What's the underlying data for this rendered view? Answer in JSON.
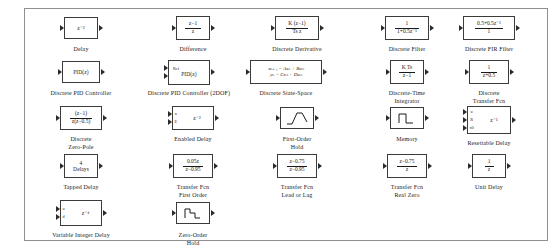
{
  "window": {
    "title": "Discrete",
    "background": "#ffffff",
    "border_color": "#8f8f8f",
    "block_border_color": "#3b3b3b",
    "text_color": "#1a1a1a"
  },
  "blocks": [
    {
      "id": "delay",
      "caption": "Delay",
      "expr": "z⁻²",
      "kind": "expr",
      "inputs": 1,
      "outputs": 1,
      "x": 38,
      "y": 14,
      "w": 32,
      "h": 22
    },
    {
      "id": "difference",
      "caption": "Difference",
      "kind": "fraction",
      "num": "z−1",
      "den": "z",
      "inputs": 1,
      "outputs": 1,
      "x": 150,
      "y": 14,
      "w": 34,
      "h": 24
    },
    {
      "id": "discrete-derivative",
      "caption": "Discrete Derivative",
      "kind": "fraction",
      "num": "K (z−1)",
      "den": "Ts z",
      "inputs": 1,
      "outputs": 1,
      "x": 248,
      "y": 14,
      "w": 44,
      "h": 24
    },
    {
      "id": "discrete-filter",
      "caption": "Discrete Filter",
      "kind": "fraction",
      "num": "1",
      "den": "1+0.5z⁻¹",
      "inputs": 1,
      "outputs": 1,
      "x": 362,
      "y": 14,
      "w": 44,
      "h": 24
    },
    {
      "id": "discrete-fir-filter",
      "caption": "Discrete FIR Filter",
      "kind": "fraction",
      "num": "0.5+0.5z⁻¹",
      "den": "1",
      "inputs": 1,
      "outputs": 1,
      "x": 472,
      "y": 14,
      "w": 50,
      "h": 24
    },
    {
      "id": "discrete-pid-controller",
      "caption": "Discrete PID Controller",
      "kind": "expr",
      "expr": "PID(z)",
      "inputs": 1,
      "outputs": 1,
      "x": 38,
      "y": 58,
      "w": 38,
      "h": 22
    },
    {
      "id": "discrete-pid-controller-2dof",
      "caption": "Discrete PID Controller (2DOF)",
      "kind": "expr-two-port",
      "expr": "PID(z)",
      "port_label": "Ref",
      "inputs": 2,
      "outputs": 1,
      "x": 150,
      "y": 58,
      "w": 42,
      "h": 24
    },
    {
      "id": "discrete-state-space",
      "caption": "Discrete State-Space",
      "kind": "equations",
      "eq1": "xₙ₊₁ = Axₙ + Buₙ",
      "eq2": "yₙ = Cxₙ + Duₙ",
      "inputs": 1,
      "outputs": 1,
      "x": 258,
      "y": 58,
      "w": 72,
      "h": 24
    },
    {
      "id": "discrete-time-integrator",
      "caption": "Discrete-Time\nIntegrator",
      "kind": "fraction",
      "num": "K Ts",
      "den": "z−1",
      "inputs": 1,
      "outputs": 1,
      "x": 362,
      "y": 58,
      "w": 32,
      "h": 24
    },
    {
      "id": "discrete-transfer-fcn",
      "caption": "Discrete\nTransfer Fcn",
      "kind": "fraction",
      "num": "1",
      "den": "z+0.5",
      "inputs": 1,
      "outputs": 1,
      "x": 472,
      "y": 58,
      "w": 40,
      "h": 24
    },
    {
      "id": "discrete-zero-pole",
      "caption": "Discrete\nZero-Pole",
      "kind": "fraction",
      "num": "(z−1)",
      "den": "z(z−0.5)",
      "inputs": 1,
      "outputs": 1,
      "x": 38,
      "y": 103,
      "w": 42,
      "h": 24
    },
    {
      "id": "enabled-delay",
      "caption": "Enabled Delay",
      "kind": "expr-two-port",
      "expr": "z⁻²",
      "port_label_1": "u",
      "port_label_2": "E",
      "inputs": 2,
      "outputs": 1,
      "x": 150,
      "y": 103,
      "w": 42,
      "h": 24
    },
    {
      "id": "first-order-hold",
      "caption": "First-Order\nHold",
      "kind": "glyph-foh",
      "inputs": 1,
      "outputs": 1,
      "x": 258,
      "y": 103,
      "w": 28,
      "h": 22
    },
    {
      "id": "memory",
      "caption": "Memory",
      "kind": "glyph-memory",
      "inputs": 1,
      "outputs": 1,
      "x": 362,
      "y": 103,
      "w": 24,
      "h": 22
    },
    {
      "id": "resettable-delay",
      "caption": "Resettable Delay",
      "kind": "expr-three-port",
      "expr": "z⁻¹",
      "port_label_1": "u",
      "port_label_2": "R",
      "port_label_3": "x0",
      "inputs": 3,
      "outputs": 1,
      "x": 472,
      "y": 103,
      "w": 44,
      "h": 28
    },
    {
      "id": "tapped-delay",
      "caption": "Tapped Delay",
      "kind": "stacked-expr",
      "line1": "4",
      "line2": "Delays",
      "inputs": 1,
      "outputs": 1,
      "x": 38,
      "y": 152,
      "w": 34,
      "h": 24
    },
    {
      "id": "transfer-fcn-first-order",
      "caption": "Transfer Fcn\nFirst Order",
      "kind": "fraction",
      "num": "0.05z",
      "den": "z−0.95",
      "inputs": 1,
      "outputs": 1,
      "x": 150,
      "y": 152,
      "w": 40,
      "h": 24
    },
    {
      "id": "transfer-fcn-lead-or-lag",
      "caption": "Transfer Fcn\nLead or Lag",
      "kind": "fraction",
      "num": "z−0.75",
      "den": "z−0.95",
      "inputs": 1,
      "outputs": 1,
      "x": 258,
      "y": 152,
      "w": 40,
      "h": 24
    },
    {
      "id": "transfer-fcn-real-zero",
      "caption": "Transfer Fcn\nReal Zero",
      "kind": "fraction",
      "num": "z−0.75",
      "den": "z",
      "inputs": 1,
      "outputs": 1,
      "x": 362,
      "y": 152,
      "w": 40,
      "h": 24
    },
    {
      "id": "unit-delay",
      "caption": "Unit Delay",
      "kind": "fraction",
      "num": "1",
      "den": "z",
      "inputs": 1,
      "outputs": 1,
      "x": 472,
      "y": 152,
      "w": 24,
      "h": 24
    },
    {
      "id": "variable-integer-delay",
      "caption": "Variable Integer Delay",
      "kind": "expr-two-port",
      "expr": "z⁻ᵈ",
      "port_label_1": "u",
      "port_label_2": "d",
      "inputs": 2,
      "outputs": 1,
      "x": 38,
      "y": 198,
      "w": 42,
      "h": 26
    },
    {
      "id": "zero-order-hold",
      "caption": "Zero-Order\nHold",
      "kind": "glyph-zoh",
      "inputs": 1,
      "outputs": 1,
      "x": 150,
      "y": 198,
      "w": 24,
      "h": 22
    }
  ]
}
